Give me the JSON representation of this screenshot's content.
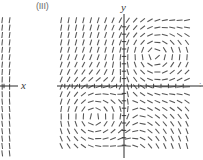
{
  "figure": {
    "panel_label": "(III)",
    "y_axis_label": "y",
    "x_axis_label": "x",
    "right_edge_label": ":",
    "stroke_color": "#555555",
    "axis_color": "#2a2a2a",
    "background": "#ffffff"
  },
  "chart_data": {
    "type": "scatter",
    "title": "(III)",
    "xlabel": "y",
    "ylabel": "x",
    "grid": false,
    "legend": null,
    "main_panel": {
      "origin_px": [
        124,
        86
      ],
      "plot_box_px": [
        59,
        18,
        192,
        154
      ],
      "grid_cols": 19,
      "grid_rows": 18,
      "cell_px": 7.4,
      "segment_length_px": 6,
      "x_range": [
        -8.8,
        9.2
      ],
      "y_range": [
        -9.2,
        9.2
      ],
      "slope_model": "angle = atan2( y*(x) , 1 ) style saddle/spiral: vertical far field, swirl centres near (+4,+4) and (-4,-4)",
      "swirl_centers": [
        [
          4.2,
          4.2
        ],
        [
          -4.2,
          -4.2
        ]
      ],
      "axis_ticks_x": [
        -8,
        -7,
        -6,
        -5,
        -4,
        -3,
        -2,
        -1,
        1,
        2,
        3,
        4,
        5,
        6,
        7,
        8
      ],
      "axis_ticks_y": [
        -8,
        -7,
        -6,
        -5,
        -4,
        -3,
        -2,
        -1,
        1,
        2,
        3,
        4,
        5,
        6,
        7,
        8
      ]
    },
    "left_panel": {
      "cropped": true,
      "plot_box_px": [
        -20,
        18,
        16,
        154
      ],
      "origin_px": [
        4,
        86
      ],
      "note": "right-hand sliver of the previous figure; segments are near vertical"
    }
  }
}
